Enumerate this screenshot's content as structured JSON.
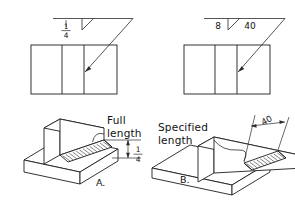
{
  "drawing": {
    "title": "Fillet weld length specification comparison",
    "background_color": "#ffffff",
    "line_color": "#1d1d1d"
  },
  "figures": [
    {
      "id": "A",
      "caption": "A.",
      "length_label": "Full length",
      "weld_symbol": {
        "size_numerator": "1",
        "size_denominator": "4",
        "length": "",
        "symbol_name": "fillet-weld-triangle"
      },
      "dimension": {
        "numerator": "1",
        "denominator": "4"
      }
    },
    {
      "id": "B",
      "caption": "B.",
      "length_label": "Specified length",
      "weld_symbol": {
        "size": "8",
        "length": "40",
        "symbol_name": "fillet-weld-triangle"
      },
      "dimension": {
        "value": "40"
      }
    }
  ],
  "labels": {
    "full_length": "Full length",
    "specified_length": "Specified length",
    "caption_a": "A.",
    "caption_b": "B.",
    "size_8": "8",
    "length_40": "40",
    "dim_40": "40",
    "frac_num": "1",
    "frac_den": "4",
    "frac_num_dim": "1",
    "frac_den_dim": "4"
  }
}
